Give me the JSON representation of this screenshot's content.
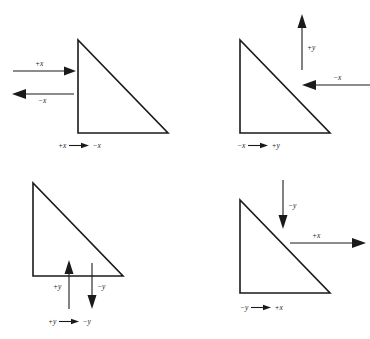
{
  "figure": {
    "stroke_color": "#1a1a1a",
    "background_color": "#ffffff"
  },
  "panels": [
    {
      "id": "top-left",
      "shape": "right-triangle",
      "arrows": [
        {
          "label": "+x",
          "direction": "right"
        },
        {
          "label": "−x",
          "direction": "left"
        }
      ],
      "caption": {
        "from": "+x",
        "to": "−x",
        "arrow": "right"
      }
    },
    {
      "id": "top-right",
      "shape": "right-triangle",
      "arrows": [
        {
          "label": "+y",
          "direction": "up"
        },
        {
          "label": "−x",
          "direction": "left"
        }
      ],
      "caption": {
        "from": "−x",
        "to": "+y",
        "arrow": "right"
      }
    },
    {
      "id": "bottom-left",
      "shape": "right-triangle",
      "arrows": [
        {
          "label": "+y",
          "direction": "up"
        },
        {
          "label": "−y",
          "direction": "down"
        }
      ],
      "caption": {
        "from": "+y",
        "to": "−y",
        "arrow": "right"
      }
    },
    {
      "id": "bottom-right",
      "shape": "right-triangle",
      "arrows": [
        {
          "label": "−y",
          "direction": "down"
        },
        {
          "label": "+x",
          "direction": "right"
        }
      ],
      "caption": {
        "from": "−y",
        "to": "+x",
        "arrow": "right"
      }
    }
  ]
}
